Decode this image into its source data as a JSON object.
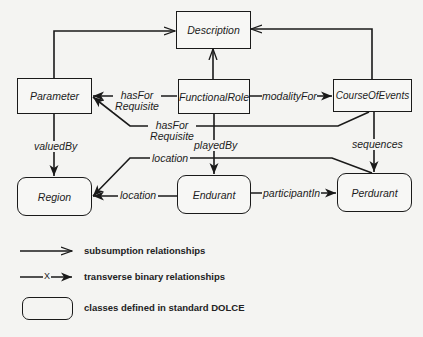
{
  "diagram": {
    "nodes": {
      "description": {
        "label": "Description",
        "standard_dolce": false
      },
      "parameter": {
        "label": "Parameter",
        "standard_dolce": false
      },
      "functional_role": {
        "label": "FunctionalRole",
        "standard_dolce": false
      },
      "course_of_events": {
        "label": "CourseOfEvents",
        "standard_dolce": false
      },
      "region": {
        "label": "Region",
        "standard_dolce": true
      },
      "endurant": {
        "label": "Endurant",
        "standard_dolce": true
      },
      "perdurant": {
        "label": "Perdurant",
        "standard_dolce": true
      }
    },
    "edges": {
      "param_subsumes": {
        "from": "Parameter",
        "to": "Description",
        "type": "subsumption"
      },
      "role_subsumes": {
        "from": "FunctionalRole",
        "to": "Description",
        "type": "subsumption"
      },
      "coe_subsumes": {
        "from": "CourseOfEvents",
        "to": "Description",
        "type": "subsumption"
      },
      "has_for_requisite_1": {
        "from": "FunctionalRole",
        "to": "Parameter",
        "label_line1": "hasFor",
        "label_line2": "Requisite"
      },
      "has_for_requisite_2": {
        "from": "CourseOfEvents",
        "to": "Parameter",
        "label_line1": "hasFor",
        "label_line2": "Requisite"
      },
      "modality_for": {
        "from": "FunctionalRole",
        "to": "CourseOfEvents",
        "label": "modalityFor"
      },
      "valued_by": {
        "from": "Parameter",
        "to": "Region",
        "label": "valuedBy"
      },
      "played_by": {
        "from": "FunctionalRole",
        "to": "Endurant",
        "label": "playedBy"
      },
      "sequences": {
        "from": "CourseOfEvents",
        "to": "Perdurant",
        "label": "sequences"
      },
      "location_perdurant": {
        "from": "Perdurant",
        "to": "Region",
        "label": "location"
      },
      "location_endurant": {
        "from": "Endurant",
        "to": "Region",
        "label": "location"
      },
      "participant_in": {
        "from": "Endurant",
        "to": "Perdurant",
        "label": "participantIn"
      }
    }
  },
  "legend": {
    "subsumption": "subsumption relationships",
    "transverse": "transverse binary relationships",
    "transverse_marker": "X",
    "dolce_classes": "classes defined in standard DOLCE"
  }
}
